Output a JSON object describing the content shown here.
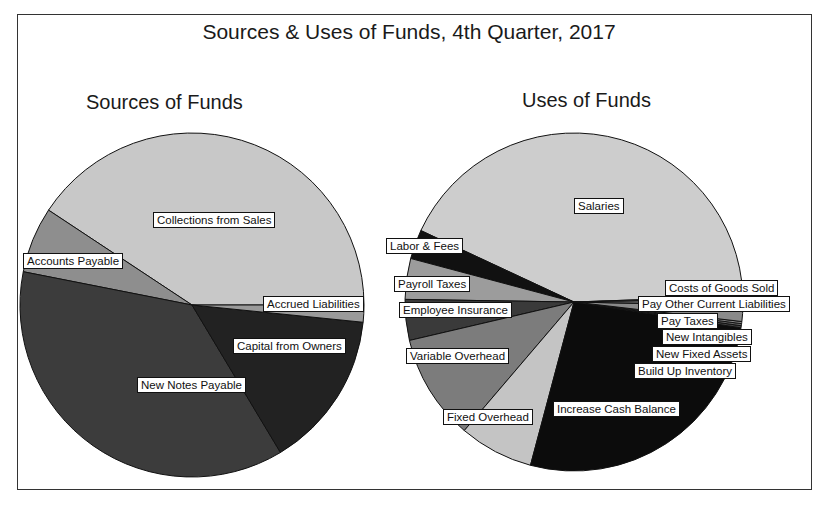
{
  "chart_data": [
    {
      "type": "pie",
      "title": "Sources & Uses of Funds, 4th Quarter, 2017",
      "subtitle": "Sources of Funds",
      "start_angle_deg": 0,
      "direction": "counterclockwise",
      "slices": [
        {
          "label": "Collections from Sales",
          "value": 40.7,
          "color": "#c8c8c8"
        },
        {
          "label": "Accounts Payable",
          "value": 6.2,
          "color": "#8e8e8e"
        },
        {
          "label": "New Notes Payable",
          "value": 36.7,
          "color": "#3c3c3c"
        },
        {
          "label": "Capital from Owners",
          "value": 14.8,
          "color": "#222222"
        },
        {
          "label": "Accrued Liabilities",
          "value": 1.6,
          "color": "#9a9a9a"
        }
      ]
    },
    {
      "type": "pie",
      "title": "Sources & Uses of Funds, 4th Quarter, 2017",
      "subtitle": "Uses of Funds",
      "start_angle_deg": 2,
      "direction": "counterclockwise",
      "slices": [
        {
          "label": "Salaries",
          "value": 42.5,
          "color": "#cdcdcd"
        },
        {
          "label": "Labor & Fees",
          "value": 2.8,
          "color": "#111111"
        },
        {
          "label": "Payroll Taxes",
          "value": 3.9,
          "color": "#9c9c9c"
        },
        {
          "label": "Employee Insurance",
          "value": 3.9,
          "color": "#3a3a3a"
        },
        {
          "label": "Variable Overhead",
          "value": 10.1,
          "color": "#7c7c7c"
        },
        {
          "label": "Fixed Overhead",
          "value": 7.1,
          "color": "#c4c4c4"
        },
        {
          "label": "Increase Cash Balance",
          "value": 26.7,
          "color": "#0c0c0c"
        },
        {
          "label": "Build Up Inventory",
          "value": 0.2,
          "color": "#444444"
        },
        {
          "label": "New Fixed Assets",
          "value": 0.2,
          "color": "#666666"
        },
        {
          "label": "New Intangibles",
          "value": 0.2,
          "color": "#888888"
        },
        {
          "label": "Pay Taxes",
          "value": 1.5,
          "color": "#8a8a8a"
        },
        {
          "label": "Pay Other Current Liabilities",
          "value": 0.7,
          "color": "#5a5a5a"
        },
        {
          "label": "Costs of Goods Sold",
          "value": 0.2,
          "color": "#a0a0a0"
        }
      ]
    }
  ],
  "chart": {
    "title": "Sources & Uses of Funds, 4th Quarter, 2017",
    "sources_title": "Sources of Funds",
    "uses_title": "Uses of Funds",
    "sources_labels": {
      "collections": "Collections from Sales",
      "accounts_payable": "Accounts Payable",
      "accrued": "Accrued Liabilities",
      "capital": "Capital from Owners",
      "new_notes": "New Notes Payable"
    },
    "uses_labels": {
      "salaries": "Salaries",
      "labor": "Labor & Fees",
      "payroll": "Payroll Taxes",
      "insurance": "Employee Insurance",
      "variable": "Variable Overhead",
      "fixed": "Fixed Overhead",
      "cash": "Increase Cash Balance",
      "cogs": "Costs of Goods Sold",
      "pay_other": "Pay Other Current Liabilities",
      "pay_taxes": "Pay Taxes",
      "intangibles": "New Intangibles",
      "fixed_assets": "New Fixed Assets",
      "inventory": "Build Up Inventory"
    }
  }
}
